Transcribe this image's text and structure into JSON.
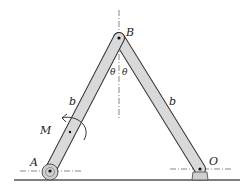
{
  "diagram": {
    "type": "mechanism",
    "labels": {
      "point_A": "A",
      "point_B": "B",
      "point_O": "O",
      "length_left": "b",
      "length_right": "b",
      "moment": "M",
      "angle_left": "θ",
      "angle_right": "θ"
    },
    "colors": {
      "bar_fill": "#d9d9d9",
      "bar_stroke": "#333333",
      "ground": "#555555",
      "line": "#333333"
    }
  }
}
